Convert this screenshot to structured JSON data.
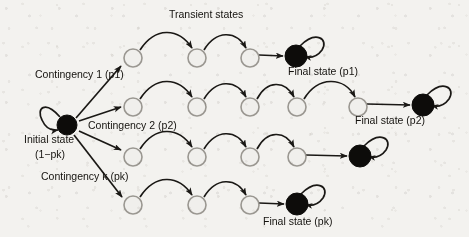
{
  "figure": {
    "title_caption": "Transient states",
    "type": "state-transition-diagram",
    "background_color": "#f3f2ef",
    "ink_color": "#1a1815",
    "open_node_fill": "#f0efec",
    "open_node_stroke": "#9a9791",
    "filled_node_fill": "#0d0c0a",
    "labels": {
      "transient_states": "Transient states",
      "initial_state_line1": "Initial state",
      "initial_state_line2_prefix": "(1",
      "initial_state_line2_minus": "−",
      "initial_state_line2_p": "p",
      "initial_state_line2_k": "k",
      "initial_state_line2_suffix": ")",
      "contingency_1": "Contingency 1 (p1)",
      "contingency_2": "Contingency 2 (p2)",
      "contingency_k_prefix": "Contingency ",
      "contingency_k_italic": "k",
      "contingency_k_suffix": " (pk)",
      "final_state_p1": "Final state (p1)",
      "final_state_p2": "Final state (p2)",
      "final_state_pk_prefix": "Final state (p",
      "final_state_pk_italic": "k",
      "final_state_pk_suffix": ")"
    },
    "initial_node": {
      "id": "initial",
      "x": 67,
      "y": 125,
      "r": 10,
      "kind": "filled",
      "self_loop": true
    },
    "branches": [
      {
        "id": "branch-1",
        "contingency_label": "Contingency 1 (p1)",
        "probability": "p1",
        "final_label": "Final state (p1)",
        "row_y": 58,
        "transient_nodes": [
          {
            "x": 133,
            "y": 58,
            "r": 9
          },
          {
            "x": 197,
            "y": 58,
            "r": 9
          },
          {
            "x": 250,
            "y": 58,
            "r": 9
          }
        ],
        "final_node": {
          "x": 296,
          "y": 56,
          "r": 11,
          "self_loop": true
        },
        "transient_count": 3
      },
      {
        "id": "branch-2",
        "contingency_label": "Contingency 2 (p2)",
        "probability": "p2",
        "final_label": "Final state (p2)",
        "row_y": 107,
        "transient_nodes": [
          {
            "x": 133,
            "y": 107,
            "r": 9
          },
          {
            "x": 197,
            "y": 107,
            "r": 9
          },
          {
            "x": 250,
            "y": 107,
            "r": 9
          },
          {
            "x": 297,
            "y": 107,
            "r": 9
          },
          {
            "x": 358,
            "y": 107,
            "r": 9
          }
        ],
        "final_node": {
          "x": 423,
          "y": 105,
          "r": 11,
          "self_loop": true
        },
        "transient_count": 5
      },
      {
        "id": "branch-3",
        "contingency_label": "",
        "probability": "",
        "final_label": "",
        "row_y": 157,
        "transient_nodes": [
          {
            "x": 133,
            "y": 157,
            "r": 9
          },
          {
            "x": 197,
            "y": 157,
            "r": 9
          },
          {
            "x": 250,
            "y": 157,
            "r": 9
          },
          {
            "x": 297,
            "y": 157,
            "r": 9
          }
        ],
        "final_node": {
          "x": 360,
          "y": 156,
          "r": 11,
          "self_loop": true
        },
        "transient_count": 4
      },
      {
        "id": "branch-k",
        "contingency_label": "Contingency k (pk)",
        "probability": "pk",
        "final_label": "Final state (pk)",
        "row_y": 205,
        "transient_nodes": [
          {
            "x": 133,
            "y": 205,
            "r": 9
          },
          {
            "x": 197,
            "y": 205,
            "r": 9
          },
          {
            "x": 250,
            "y": 205,
            "r": 9
          }
        ],
        "final_node": {
          "x": 297,
          "y": 204,
          "r": 11,
          "self_loop": true
        },
        "transient_count": 3
      }
    ]
  }
}
